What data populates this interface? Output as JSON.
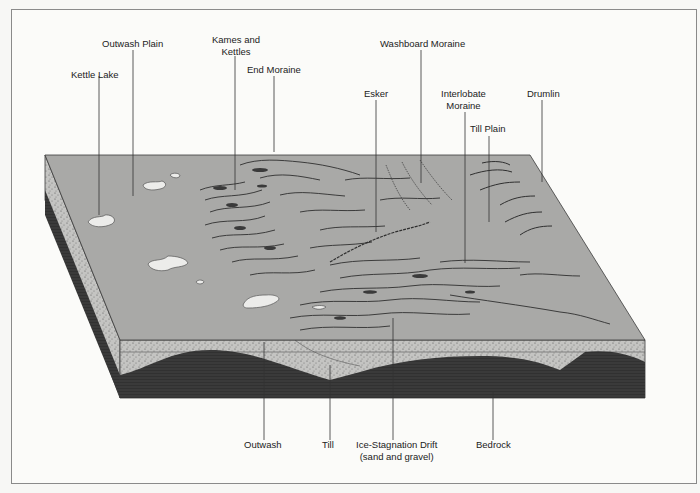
{
  "diagram": {
    "type": "block-diagram",
    "colors": {
      "surface": "#a9a9a7",
      "outwash_layer": "#c2c2c0",
      "bedrock": "#3a3a3a",
      "lake": "#ececea",
      "line": "#3b3b3b",
      "frame": "#8a8a8a"
    }
  },
  "labels_top": [
    {
      "id": "kettle-lake",
      "text": "Kettle Lake"
    },
    {
      "id": "outwash-plain",
      "text": "Outwash Plain"
    },
    {
      "id": "kames-and-kettles",
      "line1": "Kames and",
      "line2": "Kettles"
    },
    {
      "id": "end-moraine",
      "text": "End Moraine"
    },
    {
      "id": "esker",
      "text": "Esker"
    },
    {
      "id": "washboard-moraine",
      "text": "Washboard Moraine"
    },
    {
      "id": "interlobate-moraine",
      "line1": "Interlobate",
      "line2": "Moraine"
    },
    {
      "id": "till-plain",
      "text": "Till Plain"
    },
    {
      "id": "drumlin",
      "text": "Drumlin"
    }
  ],
  "labels_bottom": [
    {
      "id": "outwash",
      "text": "Outwash"
    },
    {
      "id": "till",
      "text": "Till"
    },
    {
      "id": "ice-stagnation-drift",
      "line1": "Ice-Stagnation Drift",
      "line2": "(sand and gravel)"
    },
    {
      "id": "bedrock",
      "text": "Bedrock"
    }
  ]
}
